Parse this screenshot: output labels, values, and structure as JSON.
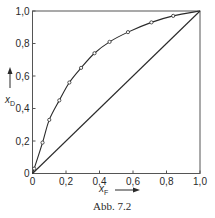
{
  "chart_data": {
    "type": "line",
    "title": "",
    "caption": "Abb. 7.2",
    "xlabel": "x",
    "xlabel_sub": "F",
    "ylabel": "x",
    "ylabel_sub": "D",
    "xlim": [
      0,
      1.0
    ],
    "ylim": [
      0,
      1.0
    ],
    "grid": false,
    "legend": null,
    "x_ticks": [
      "0",
      "0,2",
      "0,4",
      "0,6",
      "0,8",
      "1,0"
    ],
    "y_ticks": [
      "0",
      "0,2",
      "0,4",
      "0,6",
      "0,8",
      "1,0"
    ],
    "series": [
      {
        "name": "Gleichgewichtskurve",
        "style": "smooth line with circle markers",
        "x": [
          0,
          0.01,
          0.06,
          0.1,
          0.16,
          0.22,
          0.29,
          0.37,
          0.46,
          0.57,
          0.71,
          0.84,
          1.0
        ],
        "y": [
          0,
          0.03,
          0.19,
          0.33,
          0.45,
          0.56,
          0.65,
          0.74,
          0.81,
          0.87,
          0.93,
          0.97,
          1.0
        ],
        "markers_at_index": [
          1,
          2,
          3,
          4,
          5,
          6,
          7,
          8,
          9,
          10,
          11
        ]
      },
      {
        "name": "Diagonale",
        "style": "straight line",
        "x": [
          0,
          1.0
        ],
        "y": [
          0,
          1.0
        ]
      }
    ]
  },
  "colors": {
    "ink": "#2a2a2a",
    "frame": "#555555",
    "background": "#ffffff"
  }
}
